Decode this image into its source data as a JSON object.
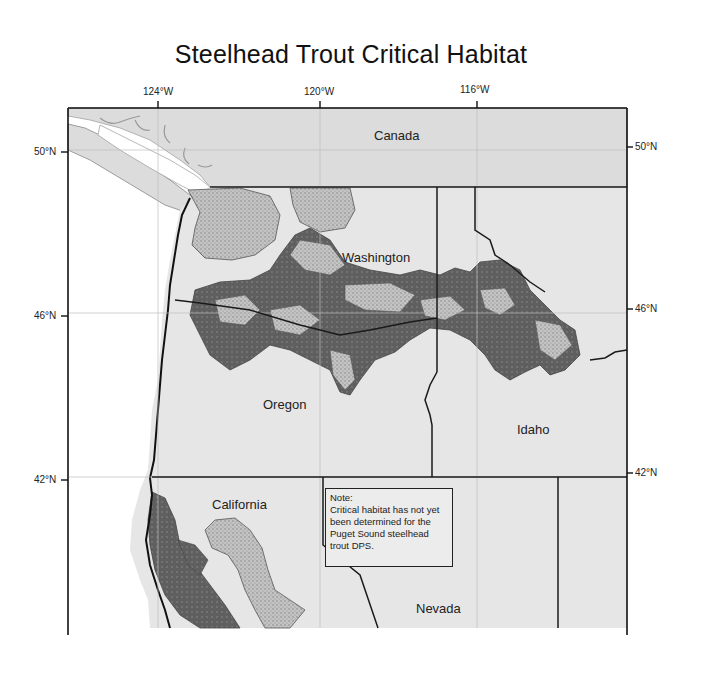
{
  "title": "Steelhead Trout Critical Habitat",
  "axes": {
    "longitude_ticks": [
      {
        "label": "124°W",
        "x": 158
      },
      {
        "label": "120°W",
        "x": 320
      },
      {
        "label": "116°W",
        "x": 477
      }
    ],
    "latitude_ticks_left": [
      {
        "label": "50°N",
        "y": 152
      },
      {
        "label": "46°N",
        "y": 316
      },
      {
        "label": "42°N",
        "y": 480
      }
    ],
    "latitude_ticks_right": [
      {
        "label": "50°N",
        "y": 147
      },
      {
        "label": "46°N",
        "y": 309
      },
      {
        "label": "42°N",
        "y": 473
      }
    ]
  },
  "regions": {
    "canada": "Canada",
    "washington": "Washington",
    "oregon": "Oregon",
    "idaho": "Idaho",
    "california": "California",
    "nevada": "Nevada"
  },
  "note": {
    "heading": "Note:",
    "text": "Critical habitat has not yet been determined for the Puget Sound steelhead trout DPS."
  },
  "colors": {
    "land": "#e6e6e6",
    "canada": "#dadada",
    "habitat_light": "#bdbdbd",
    "habitat_dark": "#666666",
    "border": "#1a1a1a",
    "water": "#ffffff",
    "graticule": "#bdbdbd"
  }
}
